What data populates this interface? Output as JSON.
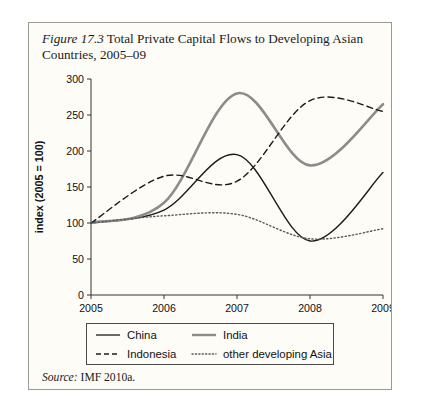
{
  "figure": {
    "label": "Figure 17.3",
    "caption": " Total Private Capital Flows to Developing Asian Countries, 2005–09",
    "source_label": "Source:",
    "source_text": " IMF 2010a."
  },
  "colors": {
    "china": "#1b1b1b",
    "india": "#8c8c8c",
    "indonesia": "#1b1b1b",
    "other": "#5a5a5a",
    "axis": "#333333",
    "frame": "#9a9a92",
    "background": "#fdfcf7"
  },
  "legend": {
    "entries": [
      {
        "label": "China",
        "style": "solid-thin",
        "color": "#1b1b1b"
      },
      {
        "label": "India",
        "style": "solid-thick",
        "color": "#8c8c8c"
      },
      {
        "label": "Indonesia",
        "style": "dashed",
        "color": "#1b1b1b"
      },
      {
        "label": "other developing Asia",
        "style": "dotted",
        "color": "#5a5a5a"
      }
    ]
  },
  "chart_data": {
    "type": "line",
    "title": "Total Private Capital Flows to Developing Asian Countries, 2005–09",
    "xlabel": "",
    "ylabel": "index (2005 = 100)",
    "x": [
      2005,
      2006,
      2007,
      2008,
      2009
    ],
    "xticklabels": [
      "2005",
      "2006",
      "2007",
      "2008",
      "2009"
    ],
    "xlim": [
      2005,
      2009
    ],
    "ylim": [
      0,
      300
    ],
    "yticks": [
      0,
      50,
      100,
      150,
      200,
      250,
      300
    ],
    "yticklabels": [
      "0",
      "50",
      "100",
      "150",
      "200",
      "250",
      "300"
    ],
    "grid": false,
    "legend_position": "below-axes",
    "series": [
      {
        "name": "China",
        "values": [
          100,
          118,
          195,
          75,
          170
        ]
      },
      {
        "name": "India",
        "values": [
          100,
          128,
          280,
          180,
          265
        ]
      },
      {
        "name": "Indonesia",
        "values": [
          100,
          165,
          158,
          270,
          255
        ]
      },
      {
        "name": "other developing Asia",
        "values": [
          100,
          110,
          112,
          78,
          92
        ]
      }
    ]
  }
}
